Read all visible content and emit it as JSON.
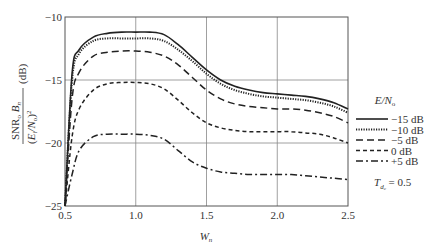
{
  "chart_data": {
    "type": "line",
    "title": "",
    "xlabel": "W_n",
    "ylabel": "SNR_o B_n / (E_i/N_o)^2 (dB)",
    "xlim": [
      0.5,
      2.5
    ],
    "ylim": [
      -25,
      -10
    ],
    "xticks": [
      "0.5",
      "1.0",
      "1.5",
      "2.0",
      "2.5"
    ],
    "yticks": [
      "-10",
      "-15",
      "-20",
      "-25"
    ],
    "grid": true,
    "legend_position": "right",
    "legend_title": "E/N_o",
    "annotation": "T_dc = 0.5",
    "x": [
      0.5,
      0.55,
      0.6,
      0.7,
      0.8,
      0.9,
      1.0,
      1.1,
      1.2,
      1.3,
      1.4,
      1.5,
      1.6,
      1.7,
      1.8,
      1.9,
      2.0,
      2.1,
      2.2,
      2.3,
      2.4,
      2.5
    ],
    "series": [
      {
        "name": "-15 dB",
        "style": "solid",
        "values": [
          -25,
          -14.5,
          -12.6,
          -11.6,
          -11.3,
          -11.2,
          -11.2,
          -11.2,
          -11.4,
          -12.2,
          -13.2,
          -14.2,
          -15.0,
          -15.5,
          -15.8,
          -16.0,
          -16.1,
          -16.2,
          -16.3,
          -16.5,
          -16.8,
          -17.3
        ]
      },
      {
        "name": "-10 dB",
        "style": "dotted",
        "values": [
          -25,
          -15.0,
          -12.9,
          -11.9,
          -11.7,
          -11.7,
          -11.7,
          -11.7,
          -11.9,
          -12.6,
          -13.5,
          -14.5,
          -15.3,
          -15.8,
          -16.1,
          -16.3,
          -16.4,
          -16.5,
          -16.6,
          -16.8,
          -17.1,
          -17.6
        ]
      },
      {
        "name": "-5 dB",
        "style": "long-dash",
        "values": [
          -25,
          -16.5,
          -14.4,
          -13.1,
          -12.8,
          -12.7,
          -12.7,
          -12.8,
          -13.1,
          -13.8,
          -14.8,
          -15.8,
          -16.5,
          -16.9,
          -17.1,
          -17.2,
          -17.3,
          -17.3,
          -17.4,
          -17.6,
          -17.9,
          -18.4
        ]
      },
      {
        "name": "0 dB",
        "style": "short-dash",
        "values": [
          -25,
          -19.5,
          -17.3,
          -15.8,
          -15.3,
          -15.2,
          -15.2,
          -15.3,
          -15.7,
          -16.6,
          -17.6,
          -18.4,
          -18.8,
          -19.0,
          -19.1,
          -19.1,
          -19.1,
          -19.1,
          -19.2,
          -19.3,
          -19.6,
          -20.0
        ]
      },
      {
        "name": "+5 dB",
        "style": "dash-dot",
        "values": [
          -25,
          -22.5,
          -20.6,
          -19.5,
          -19.3,
          -19.3,
          -19.3,
          -19.4,
          -19.7,
          -20.6,
          -21.5,
          -22.0,
          -22.3,
          -22.4,
          -22.5,
          -22.5,
          -22.5,
          -22.5,
          -22.6,
          -22.7,
          -22.8,
          -22.9
        ]
      }
    ]
  },
  "labels": {
    "y_axis_text": "SNR",
    "x_axis_text": "W",
    "legend_title": "E/N",
    "annotation": "T",
    "annotation_value": "= 0.5",
    "unit": "(dB)"
  }
}
